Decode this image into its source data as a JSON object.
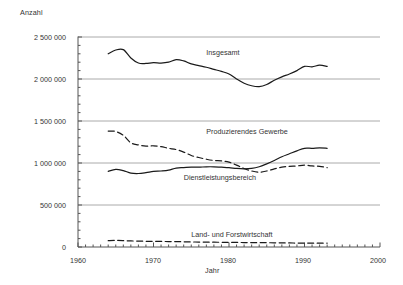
{
  "chart_data": {
    "type": "line",
    "title": "",
    "xlabel": "Jahr",
    "ylabel": "Anzahl",
    "xlim": [
      1960,
      2000
    ],
    "ylim": [
      0,
      2500000
    ],
    "grid": true,
    "legend_position": "inline-annotations",
    "x_ticks": [
      "1960",
      "1970",
      "1980",
      "1990",
      "2000"
    ],
    "x_tick_values": [
      1960,
      1970,
      1980,
      1990,
      2000
    ],
    "y_ticks": [
      "0",
      "500 000",
      "1 000 000",
      "1 500 000",
      "2 000 000",
      "2 500 000"
    ],
    "y_tick_values": [
      0,
      500000,
      1000000,
      1500000,
      2000000,
      2500000
    ],
    "minor_tick_interval": 1,
    "x": [
      1964,
      1965,
      1966,
      1967,
      1968,
      1969,
      1970,
      1971,
      1972,
      1973,
      1974,
      1975,
      1976,
      1977,
      1978,
      1979,
      1980,
      1981,
      1982,
      1983,
      1984,
      1985,
      1986,
      1987,
      1988,
      1989,
      1990,
      1991,
      1992,
      1993
    ],
    "series": [
      {
        "name": "Insgesamt",
        "style": "solid",
        "color": "#1a1a1a",
        "label_x": 1977,
        "label_y": 2310000,
        "values": [
          2300000,
          2345000,
          2350000,
          2250000,
          2190000,
          2185000,
          2195000,
          2190000,
          2200000,
          2230000,
          2215000,
          2180000,
          2160000,
          2140000,
          2115000,
          2090000,
          2060000,
          2000000,
          1950000,
          1920000,
          1910000,
          1935000,
          1985000,
          2025000,
          2060000,
          2100000,
          2150000,
          2145000,
          2165000,
          2150000
        ]
      },
      {
        "name": "Produzierendes Gewerbe",
        "style": "dashed",
        "color": "#1a1a1a",
        "label_x": 1977,
        "label_y": 1370000,
        "values": [
          1380000,
          1375000,
          1330000,
          1240000,
          1215000,
          1200000,
          1205000,
          1195000,
          1175000,
          1160000,
          1130000,
          1090000,
          1065000,
          1045000,
          1030000,
          1025000,
          1010000,
          975000,
          935000,
          905000,
          890000,
          905000,
          930000,
          950000,
          960000,
          965000,
          975000,
          965000,
          960000,
          945000
        ]
      },
      {
        "name": "Dienstleistungsbereich",
        "style": "solid",
        "color": "#1a1a1a",
        "label_x": 1974,
        "label_y": 820000,
        "values": [
          900000,
          925000,
          910000,
          880000,
          875000,
          885000,
          900000,
          905000,
          915000,
          940000,
          945000,
          950000,
          950000,
          955000,
          955000,
          950000,
          945000,
          935000,
          930000,
          935000,
          955000,
          990000,
          1030000,
          1075000,
          1110000,
          1145000,
          1175000,
          1175000,
          1180000,
          1175000
        ]
      },
      {
        "name": "Land- und Forstwirtschaft",
        "style": "dashed",
        "color": "#1a1a1a",
        "label_x": 1975,
        "label_y": 145000,
        "values": [
          75000,
          78000,
          76000,
          72000,
          70000,
          68000,
          67000,
          66000,
          65000,
          64000,
          62000,
          60000,
          59000,
          58000,
          57000,
          56000,
          55000,
          54000,
          53000,
          52000,
          51000,
          51000,
          50000,
          49000,
          48000,
          47000,
          47000,
          46000,
          46000,
          45000
        ]
      }
    ]
  },
  "colors": {
    "grid": "#aaaaaa",
    "axis": "#555555",
    "line": "#1a1a1a",
    "text": "#333333",
    "background": "#ffffff"
  }
}
